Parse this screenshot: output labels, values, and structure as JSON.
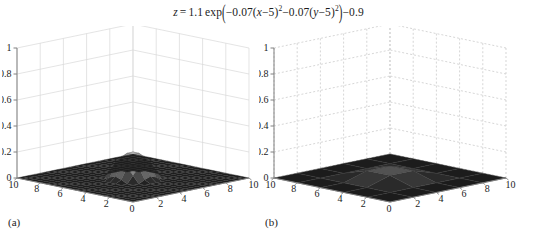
{
  "figure": {
    "equation_text": "z = 1.1 exp(−0.07(x−5)²−0.07(y−5)²)−0.9",
    "equation": {
      "lhs": "z",
      "equals": "=",
      "coefficient": "1.1",
      "exp_label": "exp",
      "open_paren": "(",
      "term1": "−0.07(",
      "term1_var": "x",
      "term1_rest": "−5)",
      "sup1": "2",
      "term2": "−0.07(",
      "term2_var": "y",
      "term2_rest": "−5)",
      "sup2": "2",
      "close_paren": ")",
      "offset": "−0.9"
    },
    "background_color": "#ffffff",
    "text_color": "#1c1c1c"
  },
  "panels": [
    {
      "id": "a",
      "label": "(a)",
      "mesh_resolution": 20,
      "grid_line_style": "solid",
      "grid_color": "#d9d9d9",
      "axis_color": "#808080",
      "zaxis": {
        "label": "",
        "ticks": [
          "0",
          "0.2",
          "0.4",
          "0.6",
          "0.8",
          "1"
        ],
        "values": [
          0,
          0.2,
          0.4,
          0.6,
          0.8,
          1
        ],
        "range": [
          0,
          1
        ]
      },
      "xaxis": {
        "label": "",
        "ticks": [
          "0",
          "2",
          "4",
          "6",
          "8",
          "10"
        ],
        "values": [
          0,
          2,
          4,
          6,
          8,
          10
        ],
        "range": [
          0,
          10
        ]
      },
      "yaxis": {
        "label": "",
        "ticks": [
          "0",
          "2",
          "4",
          "6",
          "8",
          "10"
        ],
        "values": [
          0,
          2,
          4,
          6,
          8,
          10
        ],
        "range": [
          0,
          10
        ]
      }
    },
    {
      "id": "b",
      "label": "(b)",
      "mesh_resolution": 5,
      "grid_line_style": "dashed",
      "grid_color": "#c4c4c4",
      "axis_color": "#808080",
      "zaxis": {
        "label": "",
        "ticks": [
          "0",
          "0.2",
          "0.4",
          "0.6",
          "0.8",
          "1"
        ],
        "values": [
          0,
          0.2,
          0.4,
          0.6,
          0.8,
          1
        ],
        "range": [
          0,
          1
        ]
      },
      "xaxis": {
        "label": "",
        "ticks": [
          "0",
          "2",
          "4",
          "6",
          "8",
          "10"
        ],
        "values": [
          0,
          2,
          4,
          6,
          8,
          10
        ],
        "range": [
          0,
          10
        ]
      },
      "yaxis": {
        "label": "",
        "ticks": [
          "0",
          "2",
          "4",
          "6",
          "8",
          "10"
        ],
        "values": [
          0,
          2,
          4,
          6,
          8,
          10
        ],
        "range": [
          0,
          10
        ]
      }
    }
  ],
  "chart_data": {
    "type": "surface",
    "xlabel": "x",
    "ylabel": "y",
    "zlabel": "z",
    "xlim": [
      0,
      10
    ],
    "ylim": [
      0,
      10
    ],
    "zlim": [
      0,
      1
    ],
    "formula": {
      "amplitude": 1.1,
      "decay_x": -0.07,
      "decay_y": -0.07,
      "center_x": 5,
      "center_y": 5,
      "offset": -0.9
    },
    "colormap": "gray",
    "grid": true,
    "legend": false,
    "view": {
      "azimuth": -37.5,
      "elevation": 30
    },
    "subplots": [
      {
        "label": "(a)",
        "mesh_resolution": 20,
        "description": "fine mesh surface, smooth Gaussian peak"
      },
      {
        "label": "(b)",
        "mesh_resolution": 5,
        "description": "coarse mesh surface, faceted Gaussian peak"
      }
    ],
    "peak_value": 0.2,
    "edge_value": 0.0,
    "sampled_z": {
      "note": "z at integer x,y on 0..10 grid for the plotted function clipped at 0",
      "x": [
        0,
        2,
        4,
        6,
        8,
        10
      ],
      "y": [
        0,
        2,
        4,
        6,
        8,
        10
      ],
      "z": [
        [
          0.0,
          0.0,
          0.0,
          0.0,
          0.0,
          0.0
        ],
        [
          0.0,
          0.0,
          0.0,
          0.0,
          0.0,
          0.0
        ],
        [
          0.0,
          0.0,
          0.14,
          0.14,
          0.0,
          0.0
        ],
        [
          0.0,
          0.0,
          0.14,
          0.14,
          0.0,
          0.0
        ],
        [
          0.0,
          0.0,
          0.0,
          0.0,
          0.0,
          0.0
        ],
        [
          0.0,
          0.0,
          0.0,
          0.0,
          0.0,
          0.0
        ]
      ]
    }
  }
}
